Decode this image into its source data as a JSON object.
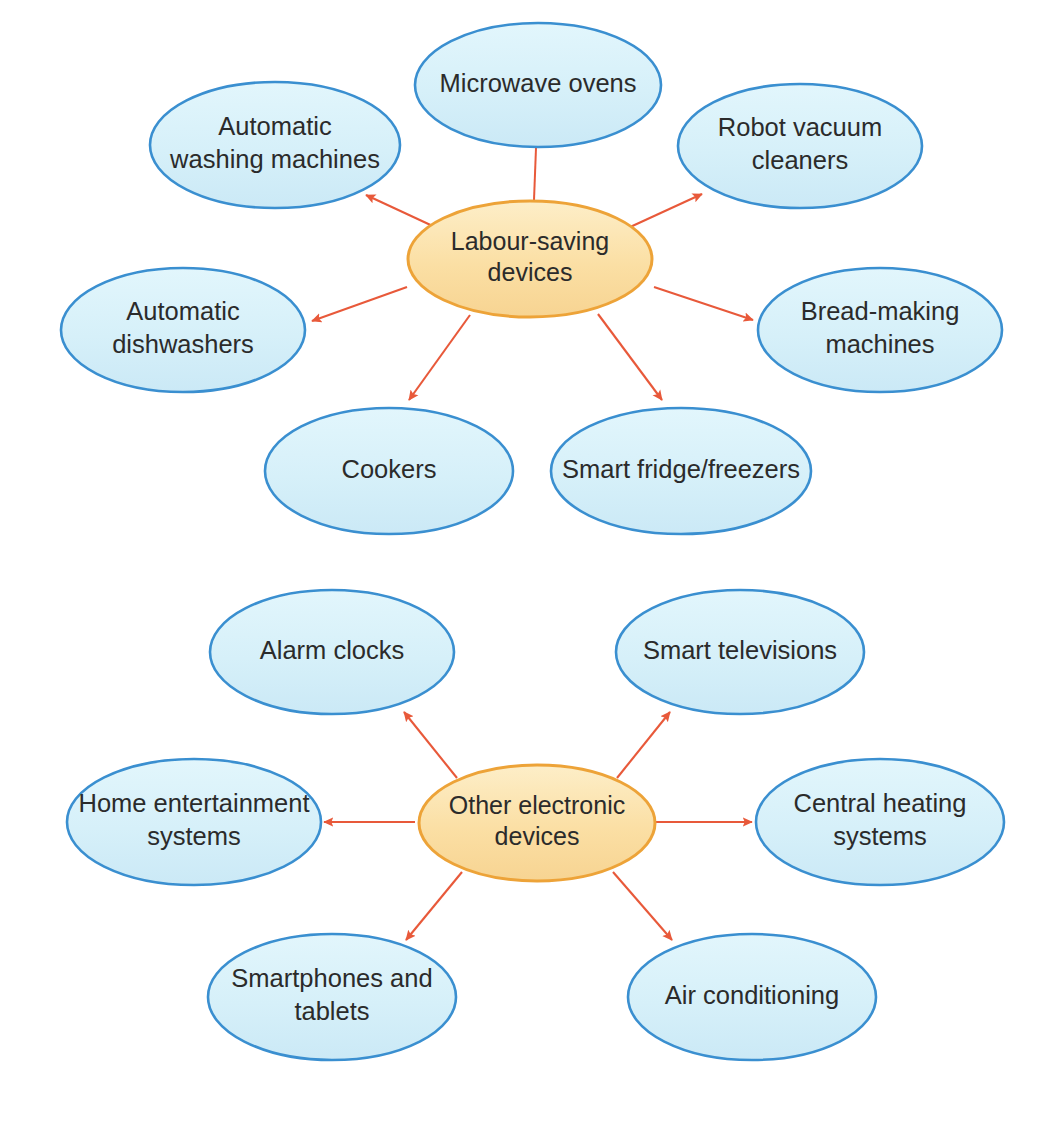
{
  "page": {
    "background_color": "#ffffff"
  },
  "style": {
    "leaf_fill": "#d6f0f9",
    "leaf_stroke": "#3a8fd0",
    "center_fill": "#fbdfa4",
    "center_stroke": "#eda338",
    "connector_color": "#e8593a",
    "text_color": "#2b2b2b"
  },
  "diagrams": [
    {
      "id": "labour-saving-devices",
      "center": {
        "label_line1": "Labour-saving",
        "label_line2": "devices",
        "cx": 530,
        "cy": 259,
        "rx": 122,
        "ry": 58
      },
      "nodes": [
        {
          "id": "microwave-ovens",
          "label_line1": "Microwave ovens",
          "label_line2": "",
          "cx": 538,
          "cy": 85,
          "rx": 123,
          "ry": 62,
          "connector": {
            "x1": 534,
            "y1": 200,
            "x2": 536,
            "y2": 148,
            "arrowhead": false
          }
        },
        {
          "id": "automatic-washing-machines",
          "label_line1": "Automatic",
          "label_line2": "washing machines",
          "cx": 275,
          "cy": 145,
          "rx": 125,
          "ry": 63,
          "connector": {
            "x1": 437,
            "y1": 228,
            "x2": 366,
            "y2": 195,
            "arrowhead": true
          }
        },
        {
          "id": "robot-vacuum-cleaners",
          "label_line1": "Robot vacuum",
          "label_line2": "cleaners",
          "cx": 800,
          "cy": 146,
          "rx": 122,
          "ry": 62,
          "connector": {
            "x1": 628,
            "y1": 228,
            "x2": 702,
            "y2": 194,
            "arrowhead": true
          }
        },
        {
          "id": "automatic-dishwashers",
          "label_line1": "Automatic",
          "label_line2": "dishwashers",
          "cx": 183,
          "cy": 330,
          "rx": 122,
          "ry": 62,
          "connector": {
            "x1": 407,
            "y1": 287,
            "x2": 312,
            "y2": 321,
            "arrowhead": true
          }
        },
        {
          "id": "bread-making-machines",
          "label_line1": "Bread-making",
          "label_line2": "machines",
          "cx": 880,
          "cy": 330,
          "rx": 122,
          "ry": 62,
          "connector": {
            "x1": 654,
            "y1": 287,
            "x2": 753,
            "y2": 320,
            "arrowhead": true
          }
        },
        {
          "id": "cookers",
          "label_line1": "Cookers",
          "label_line2": "",
          "cx": 389,
          "cy": 471,
          "rx": 124,
          "ry": 63,
          "connector": {
            "x1": 470,
            "y1": 315,
            "x2": 409,
            "y2": 400,
            "arrowhead": true
          }
        },
        {
          "id": "smart-fridge-freezers",
          "label_line1": "Smart fridge/freezers",
          "label_line2": "",
          "cx": 681,
          "cy": 471,
          "rx": 130,
          "ry": 63,
          "connector": {
            "x1": 598,
            "y1": 314,
            "x2": 662,
            "y2": 400,
            "arrowhead": true
          }
        }
      ]
    },
    {
      "id": "other-electronic-devices",
      "center": {
        "label_line1": "Other electronic",
        "label_line2": "devices",
        "cx": 537,
        "cy": 823,
        "rx": 118,
        "ry": 58
      },
      "nodes": [
        {
          "id": "alarm-clocks",
          "label_line1": "Alarm clocks",
          "label_line2": "",
          "cx": 332,
          "cy": 652,
          "rx": 122,
          "ry": 62,
          "connector": {
            "x1": 457,
            "y1": 778,
            "x2": 404,
            "y2": 712,
            "arrowhead": true
          }
        },
        {
          "id": "smart-televisions",
          "label_line1": "Smart televisions",
          "label_line2": "",
          "cx": 740,
          "cy": 652,
          "rx": 124,
          "ry": 62,
          "connector": {
            "x1": 617,
            "y1": 778,
            "x2": 670,
            "y2": 712,
            "arrowhead": true
          }
        },
        {
          "id": "home-entertainment-systems",
          "label_line1": "Home entertainment",
          "label_line2": "systems",
          "cx": 194,
          "cy": 822,
          "rx": 127,
          "ry": 63,
          "connector": {
            "x1": 415,
            "y1": 822,
            "x2": 324,
            "y2": 822,
            "arrowhead": true
          }
        },
        {
          "id": "central-heating-systems",
          "label_line1": "Central heating",
          "label_line2": "systems",
          "cx": 880,
          "cy": 822,
          "rx": 124,
          "ry": 63,
          "connector": {
            "x1": 656,
            "y1": 822,
            "x2": 752,
            "y2": 822,
            "arrowhead": true
          }
        },
        {
          "id": "smartphones-and-tablets",
          "label_line1": "Smartphones and",
          "label_line2": "tablets",
          "cx": 332,
          "cy": 997,
          "rx": 124,
          "ry": 63,
          "connector": {
            "x1": 462,
            "y1": 872,
            "x2": 406,
            "y2": 940,
            "arrowhead": true
          }
        },
        {
          "id": "air-conditioning",
          "label_line1": "Air conditioning",
          "label_line2": "",
          "cx": 752,
          "cy": 997,
          "rx": 124,
          "ry": 63,
          "connector": {
            "x1": 613,
            "y1": 872,
            "x2": 672,
            "y2": 940,
            "arrowhead": true
          }
        }
      ]
    }
  ]
}
